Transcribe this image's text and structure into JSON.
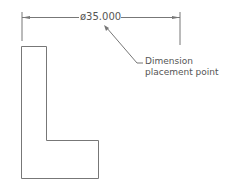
{
  "dimension": {
    "value": "ø35.000"
  },
  "callout": {
    "line1": "Dimension",
    "line2": "placement point"
  },
  "colors": {
    "line": "#777777",
    "text": "#555555"
  }
}
